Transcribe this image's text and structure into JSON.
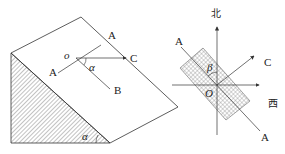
{
  "left_figure": {
    "labels": {
      "A_top": "A",
      "A_left": "A",
      "O": "o",
      "C": "C",
      "B": "B",
      "alpha_plane": "α",
      "alpha_slope": "α"
    }
  },
  "right_figure": {
    "labels": {
      "north": "北",
      "west": "西",
      "A_top": "A",
      "A_bottom": "A",
      "C": "C",
      "O": "O",
      "beta": "β"
    }
  },
  "colors": {
    "line": "#333333",
    "hatch": "#555555",
    "background": "#ffffff"
  }
}
